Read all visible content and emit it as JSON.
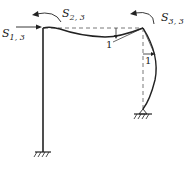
{
  "diagram": {
    "type": "structural-frame-deflection",
    "labels": {
      "s13": {
        "symbol": "S",
        "sub": "1, 3"
      },
      "s23": {
        "symbol": "S",
        "sub": "2, 3"
      },
      "s33": {
        "symbol": "S",
        "sub": "3, 3"
      },
      "rotation_beam": "1",
      "rotation_column": "1"
    },
    "supports": [
      "fixed-left-column-base",
      "pinned-right-column-base"
    ],
    "colors": {
      "line": "#222222",
      "dashed": "#555555"
    }
  }
}
